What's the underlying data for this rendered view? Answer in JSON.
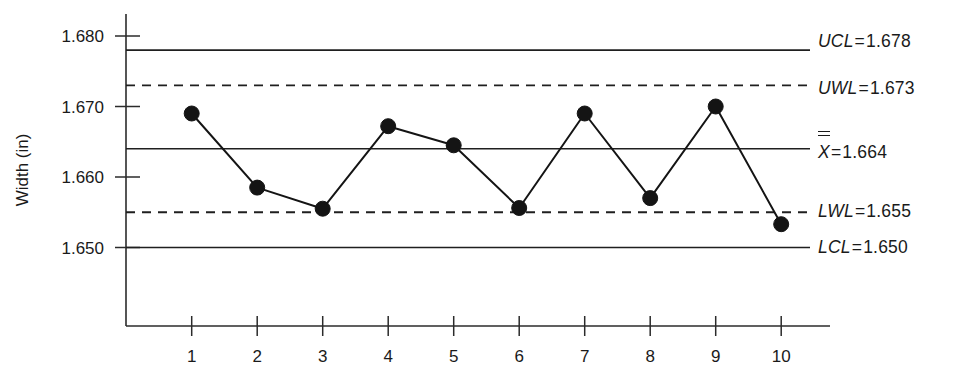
{
  "chart_data": {
    "type": "line",
    "title": "",
    "subtitle": "",
    "xlabel": "",
    "ylabel": "Width (in)",
    "x": [
      1,
      2,
      3,
      4,
      5,
      6,
      7,
      8,
      9,
      10
    ],
    "xtick_labels": [
      "1",
      "2",
      "3",
      "4",
      "5",
      "6",
      "7",
      "8",
      "9",
      "10"
    ],
    "values": [
      1.669,
      1.6585,
      1.6555,
      1.6672,
      1.6645,
      1.6556,
      1.669,
      1.657,
      1.67,
      1.6533
    ],
    "ytick_labels": [
      "1.680",
      "1.670",
      "1.660",
      "1.650"
    ],
    "yticks": [
      1.68,
      1.67,
      1.66,
      1.65
    ],
    "ylim": [
      1.6435,
      1.6845
    ],
    "xlim": [
      0.35,
      10.45
    ],
    "grid": false,
    "legend_position": "right",
    "series": [
      {
        "name": "Width (in)",
        "values": [
          1.669,
          1.6585,
          1.6555,
          1.6672,
          1.6645,
          1.6556,
          1.669,
          1.657,
          1.67,
          1.6533
        ],
        "marker": "filled-circle",
        "color": "#141414"
      }
    ],
    "reference_lines": [
      {
        "id": "ucl",
        "name": "UCL",
        "value": 1.678,
        "style": "solid",
        "label": "UCL = 1.678"
      },
      {
        "id": "uwl",
        "name": "UWL",
        "value": 1.673,
        "style": "dashed",
        "label": "UWL = 1.673"
      },
      {
        "id": "xbar",
        "name": "X̅̅",
        "value": 1.664,
        "style": "solid",
        "label": "X = 1.664"
      },
      {
        "id": "lwl",
        "name": "LWL",
        "value": 1.655,
        "style": "dashed",
        "label": "LWL = 1.655"
      },
      {
        "id": "lcl",
        "name": "LCL",
        "value": 1.65,
        "style": "solid",
        "label": "LCL = 1.650"
      }
    ]
  },
  "limits": {
    "ucl": {
      "name": "UCL",
      "equals": "=",
      "value": "1.678"
    },
    "uwl": {
      "name": "UWL",
      "equals": "=",
      "value": "1.673"
    },
    "xbar": {
      "name": "X",
      "equals": "=",
      "value": "1.664"
    },
    "lwl": {
      "name": "LWL",
      "equals": "=",
      "value": "1.655"
    },
    "lcl": {
      "name": "LCL",
      "equals": "=",
      "value": "1.650"
    }
  },
  "axes": {
    "y_title": "Width (in)",
    "y_ticks": [
      "1.680",
      "1.670",
      "1.660",
      "1.650"
    ],
    "x_ticks": [
      "1",
      "2",
      "3",
      "4",
      "5",
      "6",
      "7",
      "8",
      "9",
      "10"
    ]
  },
  "colors": {
    "ink": "#1a1a1a",
    "line": "#141414",
    "background": "#ffffff"
  }
}
